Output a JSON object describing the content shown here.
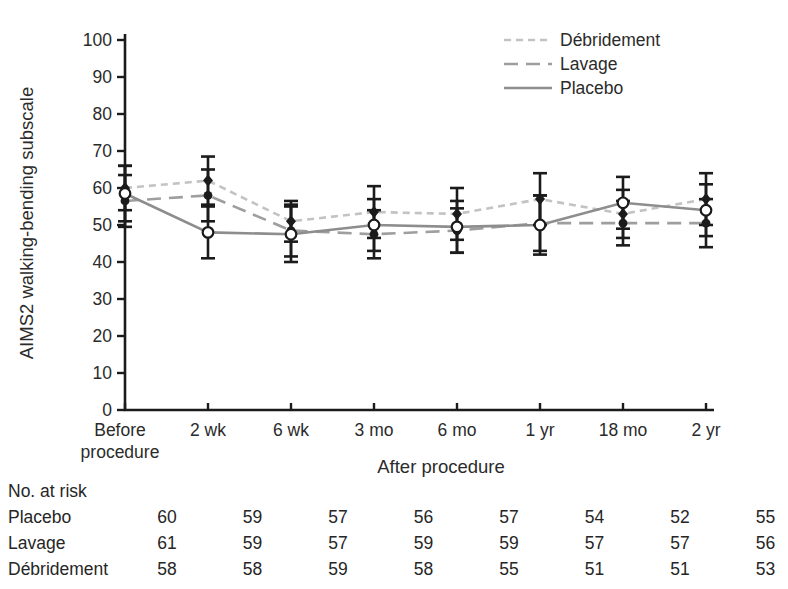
{
  "chart_data": {
    "type": "line",
    "title": "",
    "xlabel": "After procedure",
    "ylabel": "AIMS2 walking-bending subscale",
    "ylim": [
      0,
      100
    ],
    "ytick_step": 10,
    "grid": false,
    "legend_position": "top-right",
    "x_tick_lines": [
      [
        "Before",
        "procedure"
      ],
      [
        "2 wk"
      ],
      [
        "6 wk"
      ],
      [
        "3 mo"
      ],
      [
        "6 mo"
      ],
      [
        "1 yr"
      ],
      [
        "18 mo"
      ],
      [
        "2 yr"
      ]
    ],
    "categories": [
      "Before procedure",
      "2 wk",
      "6 wk",
      "3 mo",
      "6 mo",
      "1 yr",
      "18 mo",
      "2 yr"
    ],
    "series": [
      {
        "id": "debridement",
        "name": "Débridement",
        "line_style": "short-dash",
        "color": "#c3c3c3",
        "marker": "filled-diamond",
        "values": [
          60,
          62,
          51,
          53.5,
          53,
          57,
          53,
          57
        ],
        "errors": [
          6,
          6.5,
          5.5,
          7,
          7,
          7,
          6.5,
          7
        ]
      },
      {
        "id": "lavage",
        "name": "Lavage",
        "line_style": "long-dash",
        "color": "#9e9e9e",
        "marker": "filled-circle",
        "values": [
          56.5,
          58,
          48.5,
          47.5,
          48.5,
          50.5,
          50.5,
          50.5
        ],
        "errors": [
          7,
          7,
          7,
          6.5,
          6,
          7.5,
          6,
          6.5
        ]
      },
      {
        "id": "placebo",
        "name": "Placebo",
        "line_style": "solid",
        "color": "#8d8d8d",
        "marker": "open-circle",
        "values": [
          58.5,
          48,
          47.5,
          50,
          49.5,
          50,
          56,
          54
        ],
        "errors": [
          7.5,
          7,
          7.5,
          7,
          7,
          8,
          7,
          7
        ]
      }
    ],
    "colors": {
      "ink": "#1b1b1b",
      "text": "#2b2b2b",
      "error_bar": "#1b1b1b"
    }
  },
  "risk_table": {
    "title": "No. at risk",
    "rows": [
      {
        "id": "placebo",
        "label": "Placebo",
        "values": [
          60,
          59,
          57,
          56,
          57,
          54,
          52,
          55
        ]
      },
      {
        "id": "lavage",
        "label": "Lavage",
        "values": [
          61,
          59,
          57,
          59,
          59,
          57,
          57,
          56
        ]
      },
      {
        "id": "debridement",
        "label": "Débridement",
        "values": [
          58,
          58,
          59,
          58,
          55,
          51,
          51,
          53
        ]
      }
    ]
  }
}
